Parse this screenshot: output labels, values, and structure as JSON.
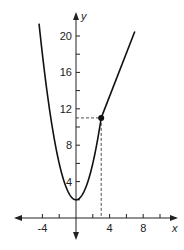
{
  "chart_data": {
    "type": "line",
    "title": "",
    "xlabel": "x",
    "ylabel": "y",
    "xlim": [
      -6,
      11
    ],
    "ylim": [
      -2,
      22
    ],
    "grid": false,
    "x_ticks": [
      -4,
      -2,
      0,
      2,
      4,
      6,
      8,
      10
    ],
    "x_tick_labels": [
      "-4",
      "4",
      "8"
    ],
    "x_tick_label_values": [
      -4,
      4,
      8
    ],
    "y_ticks": [
      2,
      4,
      6,
      8,
      10,
      12,
      14,
      16,
      18,
      20
    ],
    "y_tick_labels": [
      "4",
      "8",
      "12",
      "16",
      "20"
    ],
    "y_tick_label_values": [
      4,
      8,
      12,
      16,
      20
    ],
    "series": [
      {
        "name": "parabola piece",
        "description": "y = x^2 + 2 for x <= 3",
        "x": [
          -4.4,
          -4,
          -3,
          -2,
          -1,
          0,
          1,
          2,
          3
        ],
        "values": [
          21.36,
          18,
          11,
          6,
          3,
          2,
          3,
          6,
          11
        ]
      },
      {
        "name": "linear piece",
        "description": "line from (3, 11) upward to right",
        "x": [
          3,
          7
        ],
        "values": [
          11,
          20.5
        ]
      }
    ],
    "annotations": [
      {
        "type": "point",
        "x": 3,
        "y": 11,
        "filled": true
      },
      {
        "type": "dashed-line",
        "from": [
          0,
          11
        ],
        "to": [
          3,
          11
        ]
      },
      {
        "type": "dashed-line",
        "from": [
          3,
          11
        ],
        "to": [
          3,
          0
        ]
      }
    ]
  }
}
